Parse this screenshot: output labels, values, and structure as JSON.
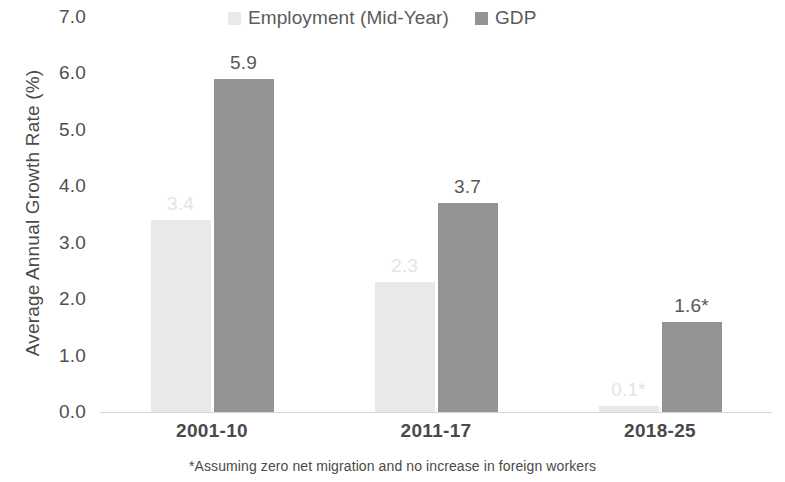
{
  "chart_data": {
    "type": "bar",
    "title": "",
    "xlabel": "",
    "ylabel": "Average Annual Growth Rate (%)",
    "ylim": [
      0,
      7
    ],
    "ytick_labels": [
      "7.0",
      "6.0",
      "5.0",
      "4.0",
      "3.0",
      "2.0",
      "1.0",
      "0.0"
    ],
    "ytick_values": [
      7,
      6,
      5,
      4,
      3,
      2,
      1,
      0
    ],
    "grid": false,
    "legend_position": "top-center",
    "categories": [
      "2001-10",
      "2011-17",
      "2018-25"
    ],
    "series": [
      {
        "name": "Employment (Mid-Year)",
        "color": "#e9e9e9",
        "values": [
          3.4,
          2.3,
          0.1
        ],
        "data_labels": [
          "3.4",
          "2.3",
          "0.1*"
        ]
      },
      {
        "name": "GDP",
        "color": "#949494",
        "values": [
          5.9,
          3.7,
          1.6
        ],
        "data_labels": [
          "5.9",
          "3.7",
          "1.6*"
        ]
      }
    ],
    "annotations": [
      "*Assuming zero net migration and no increase in foreign workers"
    ]
  },
  "legend": {
    "entries": [
      {
        "label": "Employment (Mid-Year)",
        "swatch_name": "legend-swatch-employment"
      },
      {
        "label": "GDP",
        "swatch_name": "legend-swatch-gdp"
      }
    ]
  },
  "footnote": {
    "text": "*Assuming zero net migration and no increase in foreign workers"
  },
  "colors": {
    "employment": "#e9e9e9",
    "gdp": "#949494",
    "axis_text": "#4f4f4f",
    "baseline": "#d4d4d4",
    "light_label_text": "#e4e4e4",
    "dark_label_text": "#585858"
  }
}
